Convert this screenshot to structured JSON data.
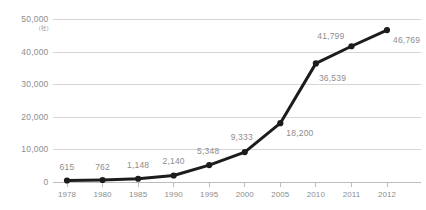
{
  "chart_data": {
    "type": "line",
    "title": "",
    "xlabel": "",
    "ylabel": "",
    "yunit": "(社)",
    "categories": [
      "1978",
      "1980",
      "1985",
      "1990",
      "1995",
      "2000",
      "2005",
      "2010",
      "2011",
      "2012"
    ],
    "values": [
      615,
      762,
      1148,
      2140,
      5348,
      9333,
      18200,
      36539,
      41799,
      46769
    ],
    "point_labels": [
      "615",
      "762",
      "1,148",
      "2,140",
      "5,348",
      "9,333",
      "18,200",
      "36,539",
      "41,799",
      "46,769"
    ],
    "ylim": [
      0,
      50000
    ],
    "ytick_values": [
      50000,
      40000,
      30000,
      20000,
      10000,
      0
    ],
    "ytick_labels": [
      "50,000",
      "40,000",
      "30,000",
      "20,000",
      "10,000",
      "0"
    ],
    "grid": true,
    "legend": "none",
    "series": [
      {
        "name": "",
        "values": [
          615,
          762,
          1148,
          2140,
          5348,
          9333,
          18200,
          36539,
          41799,
          46769
        ]
      }
    ],
    "colors": {
      "line": "#1c1c1c",
      "marker": "#1c1c1c",
      "gridline": "#d6d6d6",
      "axis": "#bdbdbd",
      "label_text": "#8d8d8d"
    }
  }
}
